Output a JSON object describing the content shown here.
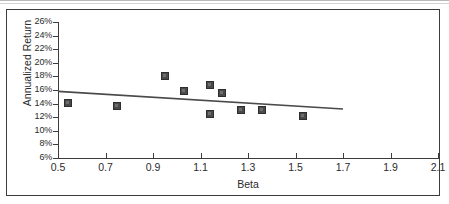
{
  "chart_data": {
    "type": "scatter",
    "title": "",
    "xlabel": "Beta",
    "ylabel": "Annualized Return",
    "xlim": [
      0.5,
      2.1
    ],
    "ylim": [
      6,
      26
    ],
    "grid": false,
    "legend": "none",
    "x_tick_labels": [
      "0.5",
      "0.7",
      "0.9",
      "1.1",
      "1.3",
      "1.5",
      "1.7",
      "1.9",
      "2.1"
    ],
    "x_tick_values": [
      0.5,
      0.7,
      0.9,
      1.1,
      1.3,
      1.5,
      1.7,
      1.9,
      2.1
    ],
    "y_tick_labels": [
      "26%",
      "24%",
      "22%",
      "20%",
      "18%",
      "16%",
      "14%",
      "12%",
      "10%",
      "8%",
      "6%"
    ],
    "y_tick_values": [
      26,
      24,
      22,
      20,
      18,
      16,
      14,
      12,
      10,
      8,
      6
    ],
    "series": [
      {
        "name": "Funds",
        "marker": "square",
        "color": "#4a4a4a",
        "points": [
          {
            "x": 0.54,
            "y": 14.1
          },
          {
            "x": 0.75,
            "y": 13.6
          },
          {
            "x": 0.95,
            "y": 18.0
          },
          {
            "x": 1.03,
            "y": 15.9
          },
          {
            "x": 1.14,
            "y": 16.8
          },
          {
            "x": 1.19,
            "y": 15.5
          },
          {
            "x": 1.14,
            "y": 12.5
          },
          {
            "x": 1.27,
            "y": 13.0
          },
          {
            "x": 1.36,
            "y": 13.0
          },
          {
            "x": 1.53,
            "y": 12.2
          }
        ]
      }
    ],
    "trendline": {
      "type": "line",
      "color": "#4a4a4a",
      "x_start": 0.5,
      "y_start": 15.8,
      "x_end": 1.7,
      "y_end": 13.2
    }
  },
  "axis": {
    "x_title": "Beta",
    "y_title": "Annualized Return"
  }
}
